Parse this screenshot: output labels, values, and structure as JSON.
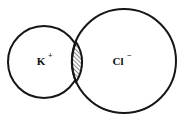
{
  "diagram": {
    "background_color": "#ffffff",
    "stroke_color": "#151515",
    "stroke_width": 2,
    "ions": [
      {
        "name": "potassium-ion",
        "symbol": "K",
        "charge": "+",
        "label": "K⁺",
        "center_x": 44,
        "center_y": 62,
        "radius": 36,
        "label_x": 41,
        "label_y": 62,
        "charge_x": 48,
        "charge_y": 57
      },
      {
        "name": "chloride-ion",
        "symbol": "Cl",
        "charge": "−",
        "label": "Cl⁻",
        "center_x": 124,
        "center_y": 61,
        "radius": 52,
        "label_x": 118,
        "label_y": 62,
        "charge_x": 127,
        "charge_y": 57
      }
    ],
    "overlap": {
      "name": "overlap-lens",
      "fill_pattern": "diagonal-hatch",
      "hatch_angle_degrees": 45,
      "hatch_spacing": 3,
      "intersection_top_x": 76,
      "intersection_top_y": 42,
      "intersection_bottom_x": 76,
      "intersection_bottom_y": 82,
      "path": "M 76 42 A 36 36 0 0 1 76 82 A 52 52 0 0 1 76 42 Z"
    }
  }
}
